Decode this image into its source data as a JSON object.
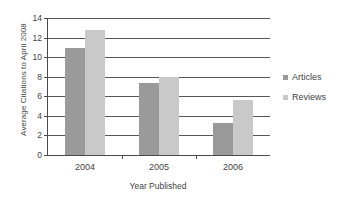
{
  "chart_data": {
    "type": "bar",
    "title": "",
    "xlabel": "Year Published",
    "ylabel": "Average Citations to April 2008",
    "categories": [
      "2004",
      "2005",
      "2006"
    ],
    "series": [
      {
        "name": "Articles",
        "color": "#9a9a9a",
        "values": [
          10.9,
          7.4,
          3.3
        ]
      },
      {
        "name": "Reviews",
        "color": "#c9c9c9",
        "values": [
          12.8,
          8.0,
          5.6
        ]
      }
    ],
    "ylim": [
      0,
      14
    ],
    "ytick_labels": [
      "0",
      "2",
      "4",
      "6",
      "8",
      "10",
      "12",
      "14"
    ],
    "ytick_values": [
      0,
      2,
      4,
      6,
      8,
      10,
      12,
      14
    ],
    "grid": true,
    "legend_position": "right"
  }
}
